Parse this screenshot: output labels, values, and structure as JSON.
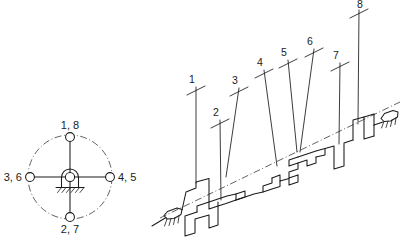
{
  "figure": {
    "ink_color": "#1a1a1a",
    "background_color": "#ffffff"
  },
  "crank_circle": {
    "name": "crank-angle-diagram",
    "center": {
      "x": 70,
      "y": 177
    },
    "radius": 42,
    "labels": {
      "top": "1, 8",
      "bottom": "2, 7",
      "left": "3, 6",
      "right": "4, 5"
    },
    "pin_positions": [
      {
        "label": "1, 8",
        "angle_deg": 90
      },
      {
        "label": "4, 5",
        "angle_deg": 0
      },
      {
        "label": "2, 7",
        "angle_deg": 270
      },
      {
        "label": "3, 6",
        "angle_deg": 180
      }
    ]
  },
  "crankshaft": {
    "name": "crankshaft-isometric-view",
    "throw_labels": [
      "1",
      "2",
      "3",
      "4",
      "5",
      "6",
      "7",
      "8"
    ],
    "bearings": [
      {
        "name": "bearing-left",
        "x": 172,
        "y": 211
      },
      {
        "name": "bearing-right",
        "x": 384,
        "y": 110
      }
    ],
    "leader_lines": [
      {
        "label": "1",
        "tip_x": 196,
        "tip_y": 87,
        "foot_x": 196,
        "foot_y": 182
      },
      {
        "label": "2",
        "tip_x": 220,
        "tip_y": 120,
        "foot_x": 221,
        "foot_y": 195
      },
      {
        "label": "3",
        "tip_x": 239,
        "tip_y": 88,
        "foot_x": 225,
        "foot_y": 174
      },
      {
        "label": "4",
        "tip_x": 264,
        "tip_y": 70,
        "foot_x": 276,
        "foot_y": 165
      },
      {
        "label": "5",
        "tip_x": 288,
        "tip_y": 60,
        "foot_x": 298,
        "foot_y": 148
      },
      {
        "label": "6",
        "tip_x": 314,
        "tip_y": 49,
        "foot_x": 300,
        "foot_y": 148
      },
      {
        "label": "7",
        "tip_x": 340,
        "tip_y": 63,
        "foot_x": 338,
        "foot_y": 140
      },
      {
        "label": "8",
        "tip_x": 360,
        "tip_y": 8,
        "foot_x": 357,
        "foot_y": 122
      }
    ]
  }
}
